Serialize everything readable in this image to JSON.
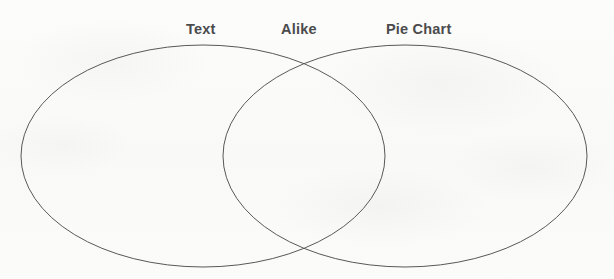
{
  "document": {
    "type": "venn-diagram-worksheet",
    "background_color": "#fbfbfa",
    "stroke_color": "#585858",
    "text_color": "#4b4b4d"
  },
  "labels": {
    "left": "Text",
    "center": "Alike",
    "right": "Pie Chart"
  },
  "chart_data": {
    "type": "venn",
    "title": "",
    "sets": [
      {
        "name": "Text",
        "label": "Text",
        "position": "left",
        "center_x": 203,
        "center_y": 156,
        "radius_x": 182,
        "radius_y": 111,
        "entries": []
      },
      {
        "name": "Pie Chart",
        "label": "Pie Chart",
        "position": "right",
        "center_x": 405,
        "center_y": 156,
        "radius_x": 182,
        "radius_y": 111,
        "entries": []
      }
    ],
    "intersection": {
      "label": "Alike",
      "entries": []
    },
    "intersection_points": [
      {
        "x": 303,
        "y": 64
      },
      {
        "x": 303,
        "y": 252
      }
    ],
    "stroke_width": 1,
    "fill": "none",
    "grid": false,
    "legend": "none"
  }
}
